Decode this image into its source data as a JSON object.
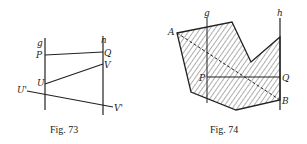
{
  "figures": [
    {
      "id": "fig73",
      "caption": "Fig. 73",
      "labels": {
        "g": "g",
        "h": "h",
        "P": "P",
        "Q": "Q",
        "U": "U",
        "V": "V",
        "U_prime": "U'",
        "V_prime": "V'"
      }
    },
    {
      "id": "fig74",
      "caption": "Fig. 74",
      "labels": {
        "g": "g",
        "h": "h",
        "A": "A",
        "B": "B",
        "P": "P",
        "Q": "Q"
      }
    }
  ]
}
